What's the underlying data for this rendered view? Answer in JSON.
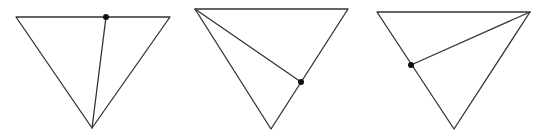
{
  "figure": {
    "width": 546,
    "height": 136,
    "background": "#ffffff",
    "stroke_color": "#333333",
    "dot_color": "#111111",
    "triangles": [
      {
        "name": "triangle-1",
        "vertices": {
          "top_left": [
            16,
            17
          ],
          "top_right": [
            170,
            17
          ],
          "bottom": [
            92,
            128
          ]
        },
        "segment": {
          "from": "bottom",
          "to_point": [
            106,
            17
          ],
          "on_edge": "top"
        },
        "dot": [
          106,
          17
        ]
      },
      {
        "name": "triangle-2",
        "vertices": {
          "top_left": [
            195,
            9
          ],
          "top_right": [
            348,
            9
          ],
          "bottom": [
            271,
            129
          ]
        },
        "segment": {
          "from": "top_left",
          "to_point": [
            301,
            82
          ],
          "on_edge": "right"
        },
        "dot": [
          301,
          82
        ]
      },
      {
        "name": "triangle-3",
        "vertices": {
          "top_left": [
            377,
            12
          ],
          "top_right": [
            530,
            12
          ],
          "bottom": [
            454,
            129
          ]
        },
        "segment": {
          "from": "top_right",
          "to_point": [
            411,
            65
          ],
          "on_edge": "left"
        },
        "dot": [
          411,
          65
        ]
      }
    ]
  }
}
